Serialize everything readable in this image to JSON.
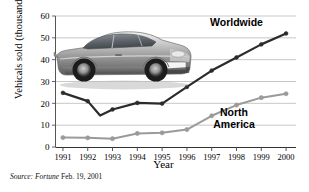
{
  "figure": {
    "source_note_prefix": "Source:",
    "source_italic": "Fortune",
    "source_rest": "Feb. 19, 2001",
    "source_full": "Source:  Fortune Feb. 19, 2001",
    "photo_alt": "silver-sports-car-photo"
  },
  "chart_data": {
    "type": "line",
    "title": "",
    "xlabel": "Year",
    "ylabel": "Vehicals sold (thousands)",
    "categories": [
      "1991",
      "1992",
      "1993",
      "1994",
      "1995",
      "1996",
      "1997",
      "1998",
      "1999",
      "2000"
    ],
    "x": [
      1991,
      1992,
      1993,
      1994,
      1995,
      1996,
      1997,
      1998,
      1999,
      2000
    ],
    "xlim": [
      1990.7,
      2000.4
    ],
    "ylim": [
      0,
      60
    ],
    "yticks": [
      0,
      10,
      20,
      30,
      40,
      50,
      60
    ],
    "ytick_labels": [
      "0",
      "10",
      "20",
      "30",
      "40",
      "50",
      "60"
    ],
    "grid": "horizontal",
    "legend_position": "inline-annotations",
    "series": [
      {
        "name": "Worldwide",
        "color": "#2b2b2b",
        "label_x": 1998.0,
        "label_y": 55.5,
        "values": [
          24.8,
          21.0,
          17.2,
          20.2,
          19.9,
          27.5,
          35.0,
          41.0,
          47.0,
          52.0
        ],
        "extra_points": [
          {
            "x": 1992.5,
            "y": 14.4
          }
        ]
      },
      {
        "name": "North America",
        "color": "#9a9a9a",
        "label_x": 1997.9,
        "label_y": 14.0,
        "values": [
          4.3,
          4.2,
          3.8,
          6.2,
          6.5,
          8.0,
          14.3,
          19.2,
          22.6,
          24.4
        ]
      }
    ]
  }
}
